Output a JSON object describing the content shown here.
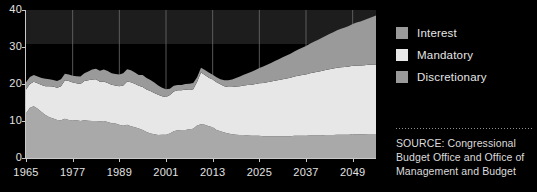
{
  "chart_data": {
    "type": "area",
    "stacked": true,
    "title": "",
    "subtitle": "",
    "xlabel": "",
    "ylabel": "",
    "xlim": [
      1965,
      2055
    ],
    "ylim": [
      0,
      40
    ],
    "grid": true,
    "grid_axis": "both",
    "legend_position": "right",
    "y_ticks": [
      "0",
      "10",
      "20",
      "30",
      "40"
    ],
    "y_tick_values": [
      0,
      10,
      20,
      30,
      40
    ],
    "x_ticks": [
      "1965",
      "1977",
      "1989",
      "2001",
      "2013",
      "2025",
      "2037",
      "2049"
    ],
    "x_tick_values": [
      1965,
      1977,
      1989,
      2001,
      2013,
      2025,
      2037,
      2049
    ],
    "series": [
      {
        "name": "Discretionary",
        "color": "#a9a9a9",
        "stack_order": 0,
        "values": [
          12.0,
          13.6,
          14.0,
          13.3,
          12.4,
          11.6,
          11.0,
          10.7,
          10.3,
          10.2,
          10.6,
          10.3,
          10.2,
          10.2,
          10.0,
          10.2,
          10.1,
          10.0,
          10.0,
          9.9,
          10.0,
          9.7,
          9.4,
          9.3,
          9.0,
          8.7,
          9.0,
          8.6,
          8.3,
          8.0,
          7.6,
          7.0,
          6.6,
          6.4,
          6.2,
          6.3,
          6.3,
          6.6,
          7.2,
          7.5,
          7.6,
          7.6,
          7.8,
          7.9,
          8.8,
          9.1,
          9.0,
          8.6,
          8.3,
          7.6,
          7.2,
          6.9,
          6.6,
          6.4,
          6.3,
          6.2,
          6.2,
          6.1,
          6.0,
          6.0,
          6.0,
          5.9,
          5.9,
          5.9,
          5.9,
          5.9,
          5.9,
          5.9,
          5.9,
          6.0,
          6.0,
          6.0,
          6.0,
          6.1,
          6.1,
          6.1,
          6.1,
          6.2,
          6.2,
          6.2,
          6.3,
          6.3,
          6.3,
          6.3,
          6.4,
          6.4,
          6.4,
          6.4,
          6.5,
          6.5,
          6.5
        ]
      },
      {
        "name": "Mandatory",
        "color": "#e7e7e7",
        "stack_order": 1,
        "values": [
          6.5,
          6.4,
          6.6,
          6.9,
          7.3,
          7.8,
          8.4,
          8.6,
          8.7,
          9.2,
          10.4,
          10.5,
          10.2,
          10.0,
          10.0,
          10.6,
          10.9,
          11.2,
          11.3,
          10.7,
          10.7,
          10.6,
          10.4,
          10.3,
          10.4,
          10.9,
          11.7,
          11.9,
          11.8,
          11.5,
          11.6,
          11.5,
          11.5,
          11.2,
          10.9,
          10.4,
          10.2,
          10.4,
          10.8,
          10.8,
          10.7,
          10.9,
          10.6,
          10.7,
          11.8,
          14.0,
          13.4,
          13.1,
          12.9,
          12.9,
          12.7,
          12.5,
          12.6,
          12.8,
          13.0,
          13.2,
          13.4,
          13.6,
          13.8,
          14.0,
          14.2,
          14.4,
          14.6,
          14.8,
          15.0,
          15.2,
          15.4,
          15.6,
          15.8,
          16.0,
          16.2,
          16.4,
          16.6,
          16.8,
          17.0,
          17.2,
          17.4,
          17.6,
          17.8,
          18.0,
          18.1,
          18.2,
          18.3,
          18.4,
          18.5,
          18.6,
          18.6,
          18.7,
          18.7,
          18.8,
          18.8
        ]
      },
      {
        "name": "Interest",
        "color": "#9a9a9a",
        "stack_order": 2,
        "values": [
          2.0,
          1.9,
          1.8,
          1.8,
          1.9,
          2.0,
          1.9,
          1.8,
          1.8,
          1.9,
          1.8,
          1.8,
          1.8,
          1.9,
          2.0,
          2.1,
          2.4,
          2.7,
          2.8,
          3.0,
          3.2,
          3.2,
          3.1,
          3.1,
          3.2,
          3.3,
          3.3,
          3.2,
          3.0,
          2.9,
          3.2,
          3.1,
          3.0,
          2.8,
          2.5,
          2.3,
          2.1,
          1.7,
          1.5,
          1.4,
          1.4,
          1.5,
          1.7,
          1.7,
          1.2,
          1.3,
          1.4,
          1.4,
          1.3,
          1.3,
          1.4,
          1.6,
          1.8,
          2.0,
          2.3,
          2.6,
          2.9,
          3.2,
          3.5,
          3.8,
          4.1,
          4.4,
          4.7,
          5.0,
          5.3,
          5.6,
          5.9,
          6.2,
          6.5,
          6.8,
          7.1,
          7.4,
          7.7,
          8.0,
          8.3,
          8.6,
          8.9,
          9.2,
          9.5,
          9.8,
          10.1,
          10.4,
          10.7,
          11.0,
          11.3,
          11.6,
          11.9,
          12.2,
          12.5,
          12.8,
          13.2
        ]
      }
    ]
  },
  "legend": {
    "items": [
      {
        "label": "Interest",
        "color": "#9a9a9a"
      },
      {
        "label": "Mandatory",
        "color": "#e7e7e7"
      },
      {
        "label": "Discretionary",
        "color": "#9a9a9a"
      }
    ]
  },
  "source": {
    "text": "SOURCE: Congressional Budget Office and Office of Management and Budget"
  },
  "colors": {
    "background": "#000000",
    "axis": "#c9c9c9",
    "gridline": "#6d6d6d",
    "text": "#e2e2e2",
    "upper_band": "#1d1d1d"
  }
}
